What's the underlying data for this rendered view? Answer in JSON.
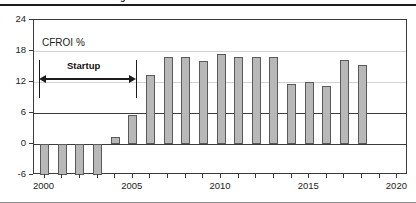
{
  "figure": {
    "clipped_title_remnant": "g",
    "series_label": "CFROI %",
    "annotation": {
      "label": "Startup",
      "start_year": 2000,
      "end_year": 2005
    }
  },
  "chart_data": {
    "type": "bar",
    "title": "",
    "subtitle": "",
    "xlabel": "",
    "ylabel": "CFROI %",
    "ylim": [
      -6,
      24
    ],
    "xlim": [
      1999.4,
      2020.6
    ],
    "y_ticks": [
      -6,
      0,
      6,
      12,
      18,
      24
    ],
    "y_tick_labels": [
      "-6",
      "0",
      "6",
      "12",
      "18",
      "24"
    ],
    "x_ticks": [
      2000,
      2001,
      2002,
      2003,
      2004,
      2005,
      2006,
      2007,
      2008,
      2009,
      2010,
      2011,
      2012,
      2013,
      2014,
      2015,
      2016,
      2017,
      2018,
      2019,
      2020
    ],
    "x_tick_labels": [
      "2000",
      "",
      "",
      "",
      "",
      "2005",
      "",
      "",
      "",
      "",
      "2010",
      "",
      "",
      "",
      "",
      "2015",
      "",
      "",
      "",
      "",
      "2020"
    ],
    "x_major_labels": [
      "2000",
      "2005",
      "2010",
      "2015",
      "2020"
    ],
    "grid": true,
    "grid_axis": "y",
    "legend": false,
    "legend_position": "none",
    "bar_color": "#b8b8b8",
    "bar_edge_color": "#5a5a5a",
    "categories": [
      2000,
      2001,
      2002,
      2003,
      2004,
      2005,
      2006,
      2007,
      2008,
      2009,
      2010,
      2011,
      2012,
      2013,
      2014,
      2015,
      2016,
      2017,
      2018,
      2019,
      2020
    ],
    "values": [
      -6.0,
      -6.0,
      -6.0,
      -6.0,
      1.3,
      5.7,
      13.3,
      16.9,
      16.9,
      16.1,
      17.4,
      16.8,
      16.9,
      16.8,
      11.6,
      12.0,
      11.2,
      16.3,
      15.2,
      null,
      null
    ],
    "annotations": [
      {
        "text": "CFROI %",
        "x": 2000.3,
        "y": 19.6
      },
      {
        "text": "Startup",
        "type": "double-arrow-span",
        "x_start": 2000,
        "x_end": 2005,
        "y": 12.0
      }
    ]
  },
  "axes": {
    "y_labels": [
      "24",
      "18",
      "12",
      "6",
      "0",
      "-6"
    ],
    "x_labels": [
      "2000",
      "2005",
      "2010",
      "2015",
      "2020"
    ]
  }
}
